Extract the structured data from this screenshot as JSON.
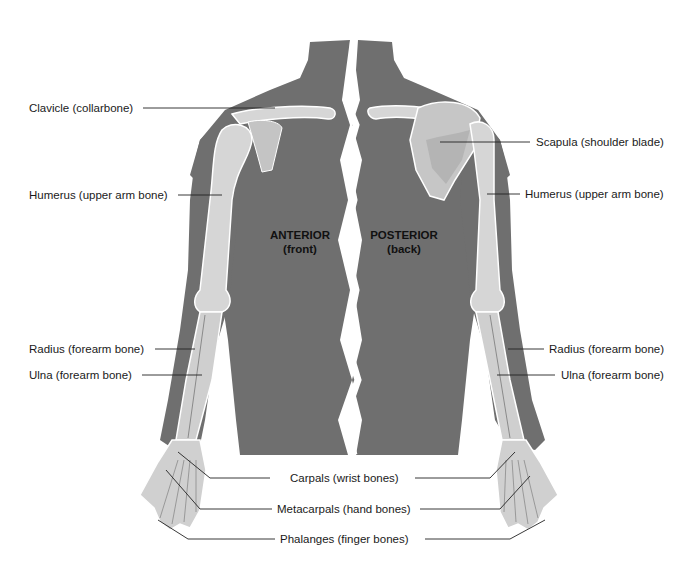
{
  "figure": {
    "colors": {
      "body": "#6f6f6f",
      "bone": "#d6d6d6",
      "bone_shadow": "#b8b8b8",
      "outline": "#ffffff",
      "leader": "#222222",
      "text": "#1a1a1a"
    },
    "views": {
      "anterior": {
        "title": "ANTERIOR",
        "subtitle": "(front)"
      },
      "posterior": {
        "title": "POSTERIOR",
        "subtitle": "(back)"
      }
    },
    "labels_left": [
      {
        "id": "clavicle",
        "text": "Clavicle (collarbone)"
      },
      {
        "id": "humerus",
        "text": "Humerus (upper arm bone)"
      },
      {
        "id": "radius",
        "text": "Radius (forearm bone)"
      },
      {
        "id": "ulna",
        "text": "Ulna (forearm bone)"
      }
    ],
    "labels_right": [
      {
        "id": "scapula",
        "text": "Scapula (shoulder blade)"
      },
      {
        "id": "humerus",
        "text": "Humerus (upper arm bone)"
      },
      {
        "id": "radius",
        "text": "Radius (forearm bone)"
      },
      {
        "id": "ulna",
        "text": "Ulna (forearm bone)"
      }
    ],
    "labels_bottom": [
      {
        "id": "carpals",
        "text": "Carpals (wrist bones)"
      },
      {
        "id": "metacarpals",
        "text": "Metacarpals (hand bones)"
      },
      {
        "id": "phalanges",
        "text": "Phalanges (finger bones)"
      }
    ]
  }
}
